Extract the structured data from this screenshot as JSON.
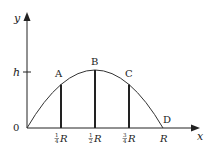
{
  "diagram": {
    "type": "projectile-trajectory",
    "axes": {
      "x_label": "x",
      "y_label": "y",
      "origin_label": "0",
      "height_label": "h"
    },
    "points": [
      {
        "name": "A",
        "label": "A"
      },
      {
        "name": "B",
        "label": "B"
      },
      {
        "name": "C",
        "label": "C"
      },
      {
        "name": "D",
        "label": "D"
      }
    ],
    "x_ticks": [
      {
        "num": "1",
        "den": "4",
        "var": "R"
      },
      {
        "num": "1",
        "den": "2",
        "var": "R"
      },
      {
        "num": "3",
        "den": "4",
        "var": "R"
      },
      {
        "var": "R"
      }
    ],
    "colors": {
      "line": "#222222",
      "background": "#ffffff"
    }
  }
}
